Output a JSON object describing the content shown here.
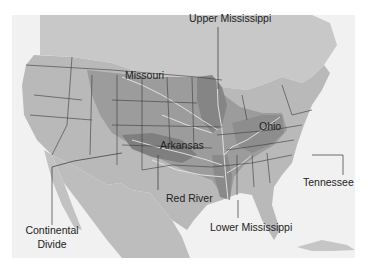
{
  "map": {
    "subject": "Mississippi River drainage basin and subregions",
    "colors": {
      "background": "#ffffff",
      "water": "#f1f1f1",
      "land": "#b9b9b9",
      "basin_light": "#9c9c9c",
      "basin_dark": "#7f7f7f",
      "rivers": "#e6e6e6",
      "borders": "#3a3a3a",
      "label_text": "#222222",
      "leader_line": "#333333"
    },
    "labels": {
      "upper_mississippi": "Upper Mississippi",
      "missouri": "Missouri",
      "ohio": "Ohio",
      "arkansas": "Arkansas",
      "red_river": "Red River",
      "tennessee": "Tennessee",
      "lower_mississippi": "Lower Mississippi",
      "continental_divide_line1": "Continental",
      "continental_divide_line2": "Divide"
    }
  }
}
